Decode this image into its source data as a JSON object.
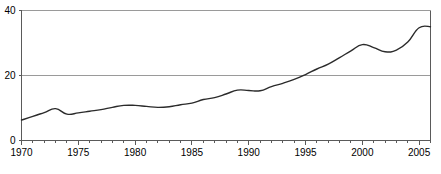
{
  "chart_data": {
    "type": "line",
    "title": "",
    "subtitle": "",
    "xlabel": "",
    "ylabel": "",
    "xlim": [
      1970,
      2006
    ],
    "ylim": [
      0,
      40
    ],
    "grid": true,
    "legend": null,
    "y_ticks": [
      "0",
      "20",
      "40"
    ],
    "y_tick_values": [
      0,
      20,
      40
    ],
    "x_ticks": [
      "1970",
      "1975",
      "1980",
      "1985",
      "1990",
      "1995",
      "2000",
      "2005"
    ],
    "x_tick_values": [
      1970,
      1975,
      1980,
      1985,
      1990,
      1995,
      2000,
      2005
    ],
    "x_minor_step": 1,
    "line_color": "#2b2b2b",
    "grid_color": "#9a9a9a",
    "axis_color": "#5a5a5a",
    "background_color": "#ffffff",
    "x": [
      1970,
      1971,
      1972,
      1973,
      1974,
      1975,
      1976,
      1977,
      1978,
      1979,
      1980,
      1981,
      1982,
      1983,
      1984,
      1985,
      1986,
      1987,
      1988,
      1989,
      1990,
      1991,
      1992,
      1993,
      1994,
      1995,
      1996,
      1997,
      1998,
      1999,
      2000,
      2001,
      2002,
      2003,
      2004,
      2005,
      2006
    ],
    "values": [
      6.3,
      7.4,
      8.6,
      9.8,
      8.1,
      8.5,
      9.0,
      9.5,
      10.2,
      10.8,
      10.8,
      10.5,
      10.2,
      10.4,
      11.0,
      11.5,
      12.6,
      13.2,
      14.3,
      15.5,
      15.4,
      15.3,
      16.6,
      17.6,
      18.8,
      20.3,
      22.0,
      23.5,
      25.5,
      27.6,
      29.5,
      28.6,
      27.3,
      27.8,
      30.3,
      34.7,
      35.0
    ],
    "series": [
      {
        "name": "series-1",
        "values": [
          6.3,
          7.4,
          8.6,
          9.8,
          8.1,
          8.5,
          9.0,
          9.5,
          10.2,
          10.8,
          10.8,
          10.5,
          10.2,
          10.4,
          11.0,
          11.5,
          12.6,
          13.2,
          14.3,
          15.5,
          15.4,
          15.3,
          16.6,
          17.6,
          18.8,
          20.3,
          22.0,
          23.5,
          25.5,
          27.6,
          29.5,
          28.6,
          27.3,
          27.8,
          30.3,
          34.7,
          35.0
        ]
      }
    ]
  }
}
